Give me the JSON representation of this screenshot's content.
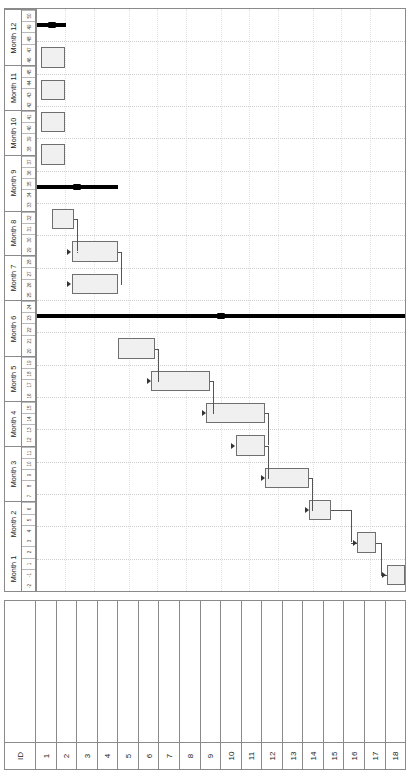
{
  "chart_data": {
    "type": "bar",
    "title": "",
    "xlabel": "Task Name",
    "ylabel": "Timeline (Months / Weeks)",
    "orientation": "gantt-rotated-90",
    "table_headers": {
      "id": "ID",
      "name": "Task Name"
    },
    "months": [
      {
        "label": "Month 1",
        "weeks": [
          "-2",
          "-1",
          "1",
          "2"
        ]
      },
      {
        "label": "Month 2",
        "weeks": [
          "3",
          "4",
          "5",
          "6"
        ]
      },
      {
        "label": "Month 3",
        "weeks": [
          "7",
          "8",
          "9",
          "10",
          "11"
        ]
      },
      {
        "label": "Month 4",
        "weeks": [
          "12",
          "13",
          "14",
          "15"
        ]
      },
      {
        "label": "Month 5",
        "weeks": [
          "16",
          "17",
          "18",
          "19"
        ]
      },
      {
        "label": "Month 6",
        "weeks": [
          "20",
          "21",
          "22",
          "23",
          "24"
        ]
      },
      {
        "label": "Month 7",
        "weeks": [
          "25",
          "26",
          "27",
          "28"
        ]
      },
      {
        "label": "Month 8",
        "weeks": [
          "29",
          "30",
          "31",
          "32"
        ]
      },
      {
        "label": "Month 9",
        "weeks": [
          "33",
          "34",
          "35",
          "36",
          "37"
        ]
      },
      {
        "label": "Month 10",
        "weeks": [
          "38",
          "39",
          "40",
          "41"
        ]
      },
      {
        "label": "Month 11",
        "weeks": [
          "42",
          "43",
          "44",
          "45"
        ]
      },
      {
        "label": "Month 12",
        "weeks": [
          "46",
          "47",
          "48",
          "49",
          "50"
        ]
      }
    ],
    "categories": [
      "Strategy",
      "Defining services",
      "Current arrangements",
      "Identifying stakeholders",
      "Employment legislation",
      "Tender Documents",
      "Service specifications",
      "Service level agreement",
      "Conditions of contract",
      "Tendering Process",
      "Tenderer briefing",
      "Tendering period",
      "Tender assessment",
      "Pre-contract meeting",
      "Contract award",
      "Mobilisation of resources",
      "1st performance review",
      "Quarterly review"
    ],
    "tasks": [
      {
        "id": "1",
        "name": "Strategy",
        "type": "summary",
        "start_week": -2,
        "end_week": 2,
        "start_pct": 0.0,
        "end_pct": 8.0
      },
      {
        "id": "2",
        "name": "Defining services",
        "type": "task",
        "start_week": -1,
        "end_week": 2,
        "start_pct": 1.2,
        "end_pct": 7.6
      },
      {
        "id": "3",
        "name": "Current arrangements",
        "type": "task",
        "start_week": -1,
        "end_week": 2,
        "start_pct": 1.2,
        "end_pct": 7.6
      },
      {
        "id": "4",
        "name": "Identifying stakeholders",
        "type": "task",
        "start_week": -1,
        "end_week": 2,
        "start_pct": 1.2,
        "end_pct": 7.6
      },
      {
        "id": "5",
        "name": "Employment legislation",
        "type": "task",
        "start_week": -1,
        "end_week": 2,
        "start_pct": 1.2,
        "end_pct": 7.6
      },
      {
        "id": "6",
        "name": "Tender Documents",
        "type": "summary",
        "start_week": -2,
        "end_week": 7,
        "start_pct": 0.0,
        "end_pct": 22.0
      },
      {
        "id": "7",
        "name": "Service specifications",
        "type": "task",
        "start_week": 1,
        "end_week": 4,
        "start_pct": 4.0,
        "end_pct": 10.0
      },
      {
        "id": "8",
        "name": "Service level agreement",
        "type": "task",
        "start_week": 4,
        "end_week": 8,
        "start_pct": 9.5,
        "end_pct": 22.0
      },
      {
        "id": "9",
        "name": "Conditions of contract",
        "type": "task",
        "start_week": 4,
        "end_week": 8,
        "start_pct": 9.5,
        "end_pct": 22.0
      },
      {
        "id": "10",
        "name": "Tendering Process",
        "type": "summary",
        "start_week": -2,
        "end_week": 50,
        "start_pct": 0.0,
        "end_pct": 100.0
      },
      {
        "id": "11",
        "name": "Tenderer briefing",
        "type": "task",
        "start_week": 9,
        "end_week": 12,
        "start_pct": 22.0,
        "end_pct": 32.0
      },
      {
        "id": "12",
        "name": "Tendering period",
        "type": "task",
        "start_week": 12,
        "end_week": 17,
        "start_pct": 31.0,
        "end_pct": 47.0
      },
      {
        "id": "13",
        "name": "Tender assessment",
        "type": "task",
        "start_week": 17,
        "end_week": 22,
        "start_pct": 46.0,
        "end_pct": 62.0
      },
      {
        "id": "14",
        "name": "Pre-contract meeting",
        "type": "task",
        "start_week": 22,
        "end_week": 26,
        "start_pct": 54.0,
        "end_pct": 62.0
      },
      {
        "id": "15",
        "name": "Contract award",
        "type": "task",
        "start_week": 26,
        "end_week": 31,
        "start_pct": 62.0,
        "end_pct": 74.0
      },
      {
        "id": "16",
        "name": "Mobilisation of resources",
        "type": "task",
        "start_week": 31,
        "end_week": 38,
        "start_pct": 74.0,
        "end_pct": 80.0
      },
      {
        "id": "17",
        "name": "1st performance review",
        "type": "task",
        "start_week": 38,
        "end_week": 40,
        "start_pct": 87.0,
        "end_pct": 92.0
      },
      {
        "id": "18",
        "name": "Quarterly review",
        "type": "task",
        "start_week": 47,
        "end_week": 49,
        "start_pct": 95.0,
        "end_pct": 100.0
      }
    ],
    "colors": {
      "task_fill": "#f0f0f0",
      "task_border": "#6f6f6f",
      "summary_fill": "#000000",
      "grid": "#cfcfcf",
      "frame": "#8a8a8a"
    },
    "legend": [],
    "grid": true
  }
}
